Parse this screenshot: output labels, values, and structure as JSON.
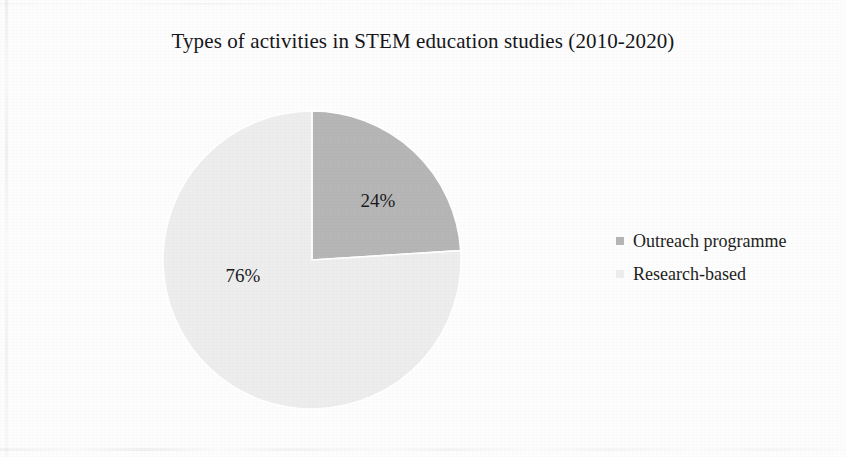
{
  "figure": {
    "title": "Types of activities in STEM education studies (2010-2020)",
    "background_color": "#fdfdfd"
  },
  "legend": {
    "position": "right",
    "items": [
      {
        "label": "Outreach programme",
        "color": "#b6b6b6",
        "swatch_icon": "legend-swatch-square"
      },
      {
        "label": "Research-based",
        "color": "#ededed",
        "swatch_icon": "legend-swatch-square"
      }
    ]
  },
  "chart_data": {
    "type": "pie",
    "title": "Types of activities in STEM education studies (2010-2020)",
    "xlabel": "",
    "ylabel": "",
    "unit": "percent",
    "categories": [
      "Outreach programme",
      "Research-based"
    ],
    "values": [
      24,
      76
    ],
    "data_labels": [
      "24%",
      "76%"
    ],
    "colors": [
      "#b6b6b6",
      "#ededed"
    ],
    "slice_border_color": "#ffffff",
    "start_angle_deg": 0,
    "direction": "clockwise",
    "grid": false,
    "legend_position": "right",
    "slices": [
      {
        "name": "Outreach programme",
        "value": 24,
        "label": "24%",
        "color": "#b6b6b6",
        "start_angle_deg": 0,
        "end_angle_deg": 86.4
      },
      {
        "name": "Research-based",
        "value": 76,
        "label": "76%",
        "color": "#ededed",
        "start_angle_deg": 86.4,
        "end_angle_deg": 360
      }
    ]
  }
}
